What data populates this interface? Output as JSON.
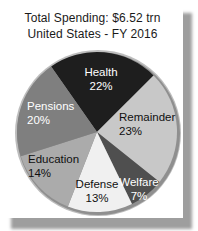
{
  "header": {
    "title_line1": "Total Spending: $6.52 trn",
    "title_line2": "United States - FY 2016"
  },
  "chart_data": {
    "type": "pie",
    "title": "Total Spending: $6.52 trn",
    "subtitle": "United States - FY 2016",
    "total_label": "$6.52 trn",
    "unit": "%",
    "direction": "clockwise",
    "start_angle_deg": -35,
    "legend_position": "none",
    "labels_on_slices": true,
    "slices": [
      {
        "label": "Health",
        "value": 22,
        "display": "22%",
        "color": "#1e1e1e",
        "text_color": "#ffffff",
        "label_pos": {
          "x": 89,
          "y": 29,
          "anchor": "middle"
        }
      },
      {
        "label": "Remainder",
        "value": 23,
        "display": "23%",
        "color": "#c8c8c8",
        "text_color": "#101010",
        "label_pos": {
          "x": 107,
          "y": 74,
          "anchor": "start"
        }
      },
      {
        "label": "Welfare",
        "value": 7,
        "display": "7%",
        "color": "#4f4f4f",
        "text_color": "#ffffff",
        "label_pos": {
          "x": 127,
          "y": 139,
          "anchor": "middle"
        }
      },
      {
        "label": "Defense",
        "value": 13,
        "display": "13%",
        "color": "#f0f0f0",
        "text_color": "#101010",
        "label_pos": {
          "x": 85,
          "y": 141,
          "anchor": "middle"
        }
      },
      {
        "label": "Education",
        "value": 14,
        "display": "14%",
        "color": "#ababab",
        "text_color": "#101010",
        "label_pos": {
          "x": 16,
          "y": 116,
          "anchor": "start"
        }
      },
      {
        "label": "Pensions",
        "value": 20,
        "display": "20%",
        "color": "#7f7f7f",
        "text_color": "#ffffff",
        "label_pos": {
          "x": 15,
          "y": 63,
          "anchor": "start"
        }
      }
    ]
  },
  "colors": {
    "card_bg": "#ffffff",
    "card_shadow": "#9e9e9e",
    "pie_rim_dark": "#8f8f8f",
    "pie_rim_light": "#bdbdbd",
    "title_text": "#1a1a1a"
  }
}
